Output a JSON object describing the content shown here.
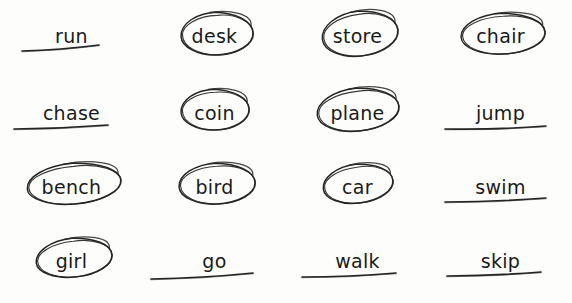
{
  "worksheet": {
    "title": "Handwritten worksheet: circled and underlined words",
    "background_color": "#fdfdfc",
    "ink_color": "#262626",
    "text_color": "#1a1a1a",
    "columns": 4,
    "rows": 4,
    "mark_types": [
      "circle",
      "underline"
    ],
    "items": [
      {
        "word": "run",
        "mark": "underline",
        "row": 0,
        "col": 0
      },
      {
        "word": "desk",
        "mark": "circle",
        "row": 0,
        "col": 1
      },
      {
        "word": "store",
        "mark": "circle",
        "row": 0,
        "col": 2
      },
      {
        "word": "chair",
        "mark": "circle",
        "row": 0,
        "col": 3
      },
      {
        "word": "chase",
        "mark": "underline",
        "row": 1,
        "col": 0
      },
      {
        "word": "coin",
        "mark": "circle",
        "row": 1,
        "col": 1
      },
      {
        "word": "plane",
        "mark": "circle",
        "row": 1,
        "col": 2
      },
      {
        "word": "jump",
        "mark": "underline",
        "row": 1,
        "col": 3
      },
      {
        "word": "bench",
        "mark": "circle",
        "row": 2,
        "col": 0
      },
      {
        "word": "bird",
        "mark": "circle",
        "row": 2,
        "col": 1
      },
      {
        "word": "car",
        "mark": "circle",
        "row": 2,
        "col": 2
      },
      {
        "word": "swim",
        "mark": "underline",
        "row": 2,
        "col": 3
      },
      {
        "word": "girl",
        "mark": "circle",
        "row": 3,
        "col": 0
      },
      {
        "word": "go",
        "mark": "underline",
        "row": 3,
        "col": 1
      },
      {
        "word": "walk",
        "mark": "underline",
        "row": 3,
        "col": 2
      },
      {
        "word": "skip",
        "mark": "underline",
        "row": 3,
        "col": 3
      }
    ]
  }
}
